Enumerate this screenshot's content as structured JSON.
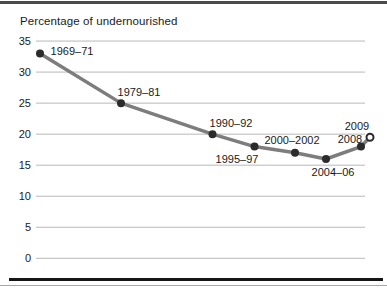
{
  "chart_data": {
    "type": "line",
    "title": "Percentage of undernourished",
    "xlabel": "",
    "ylabel": "",
    "ylim": [
      0,
      35
    ],
    "yticks": [
      35,
      30,
      25,
      20,
      15,
      10,
      5,
      0
    ],
    "grid": true,
    "legend": false,
    "categories": [
      "1969–71",
      "1979–81",
      "1990–92",
      "1995–97",
      "2000–2002",
      "2004–06",
      "2008",
      "2009"
    ],
    "points": [
      {
        "label": "1969–71",
        "value": 33,
        "marker": "filled"
      },
      {
        "label": "1979–81",
        "value": 25,
        "marker": "filled"
      },
      {
        "label": "1990–92",
        "value": 20,
        "marker": "filled"
      },
      {
        "label": "1995–97",
        "value": 18,
        "marker": "filled"
      },
      {
        "label": "2000–2002",
        "value": 17,
        "marker": "filled"
      },
      {
        "label": "2004–06",
        "value": 16,
        "marker": "filled"
      },
      {
        "label": "2008",
        "value": 18,
        "marker": "filled"
      },
      {
        "label": "2009",
        "value": 19.5,
        "marker": "open"
      }
    ],
    "colors": {
      "line": "#7d7d7d",
      "marker": "#2b2b2b",
      "open_marker_fill": "#ffffff",
      "grid": "#b8b8b8",
      "text": "#1a1a1a"
    },
    "layout": {
      "y_zero_px": 258.3,
      "px_per_unit": 6.207,
      "grid_x": [
        36,
        365
      ],
      "tick_label_x": 31,
      "x_px": [
        40,
        121,
        212.5,
        254.5,
        295,
        326,
        361,
        370
      ],
      "label_px": [
        [
          72,
          55
        ],
        [
          139,
          96
        ],
        [
          231,
          127
        ],
        [
          237,
          163
        ],
        [
          292,
          144
        ],
        [
          333,
          176
        ],
        [
          350,
          143
        ],
        [
          357,
          130
        ]
      ]
    }
  }
}
